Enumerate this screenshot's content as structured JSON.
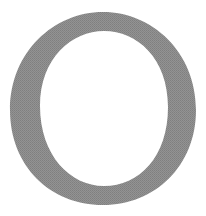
{
  "glyph": {
    "character": "O",
    "style": "serif",
    "color": "#8c8c8c",
    "background": "#ffffff"
  }
}
